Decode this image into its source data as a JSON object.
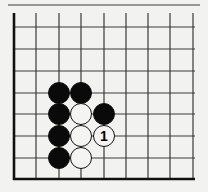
{
  "diagram": {
    "type": "go-board-fragment",
    "colors": {
      "background": "#f2f2f0",
      "line": "#3a3a3a",
      "edge": "#111111",
      "black_stone": "#0a0a0a",
      "white_stone": "#f4f4f2"
    },
    "grid": {
      "x_lines": [
        14,
        36,
        59,
        81,
        104,
        126,
        148,
        170,
        193
      ],
      "y_lines": [
        5,
        27,
        49,
        71,
        93,
        114,
        136,
        158,
        179
      ],
      "left_edge_thick": true,
      "bottom_edge_thick": true
    },
    "stones": [
      {
        "color": "black",
        "col": 2,
        "row": 4,
        "label": ""
      },
      {
        "color": "black",
        "col": 3,
        "row": 4,
        "label": ""
      },
      {
        "color": "black",
        "col": 2,
        "row": 5,
        "label": ""
      },
      {
        "color": "white",
        "col": 3,
        "row": 5,
        "label": ""
      },
      {
        "color": "black",
        "col": 4,
        "row": 5,
        "label": ""
      },
      {
        "color": "black",
        "col": 2,
        "row": 6,
        "label": ""
      },
      {
        "color": "white",
        "col": 3,
        "row": 6,
        "label": ""
      },
      {
        "color": "white",
        "col": 4,
        "row": 6,
        "label": "1"
      },
      {
        "color": "black",
        "col": 2,
        "row": 7,
        "label": ""
      },
      {
        "color": "white",
        "col": 3,
        "row": 7,
        "label": ""
      }
    ]
  }
}
